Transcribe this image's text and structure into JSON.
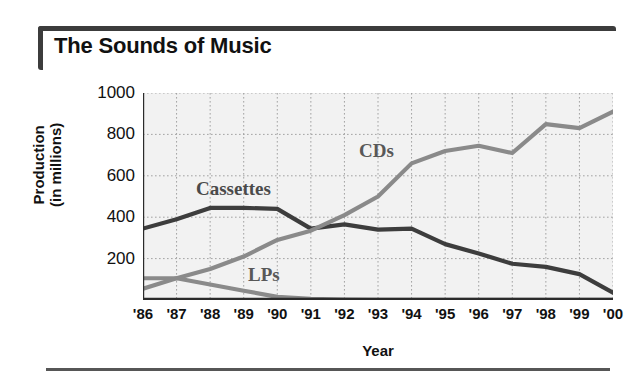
{
  "title": "The Sounds of Music",
  "axis": {
    "x_label": "Year",
    "y_label_line1": "Production",
    "y_label_line2": "(in millions)"
  },
  "annotations": {
    "cds": "CDs",
    "cassettes": "Cassettes",
    "lps": "LPs"
  },
  "colors": {
    "cassettes_line": "#3d3d3d",
    "cds_line": "#8a8a8a",
    "lps_line": "#8a8a8a",
    "plot_background": "#f2f2f2",
    "gridline": "#9a9a9a",
    "axis": "#2b2b2b",
    "rule": "#3c3c3c"
  },
  "chart_data": {
    "type": "line",
    "title": "The Sounds of Music",
    "xlabel": "Year",
    "ylabel": "Production (in millions)",
    "x": [
      "'86",
      "'87",
      "'88",
      "'89",
      "'90",
      "'91",
      "'92",
      "'93",
      "'94",
      "'95",
      "'96",
      "'97",
      "'98",
      "'99",
      "'00"
    ],
    "ylim": [
      0,
      1000
    ],
    "yticks": [
      200,
      400,
      600,
      800,
      1000
    ],
    "ytick_labels": [
      "200",
      "400",
      "600",
      "800",
      "1000"
    ],
    "grid": true,
    "legend": "inline-annotations",
    "series": [
      {
        "name": "Cassettes",
        "color": "#3d3d3d",
        "values": [
          345,
          390,
          445,
          445,
          440,
          345,
          365,
          340,
          345,
          270,
          225,
          175,
          160,
          125,
          35
        ]
      },
      {
        "name": "CDs",
        "color": "#8a8a8a",
        "values": [
          55,
          105,
          150,
          210,
          290,
          335,
          410,
          500,
          660,
          720,
          745,
          710,
          850,
          830,
          910
        ]
      },
      {
        "name": "LPs",
        "color": "#8a8a8a",
        "values": [
          105,
          105,
          75,
          45,
          15,
          5,
          2,
          1,
          1,
          1,
          1,
          1,
          1,
          1,
          1
        ]
      }
    ]
  }
}
